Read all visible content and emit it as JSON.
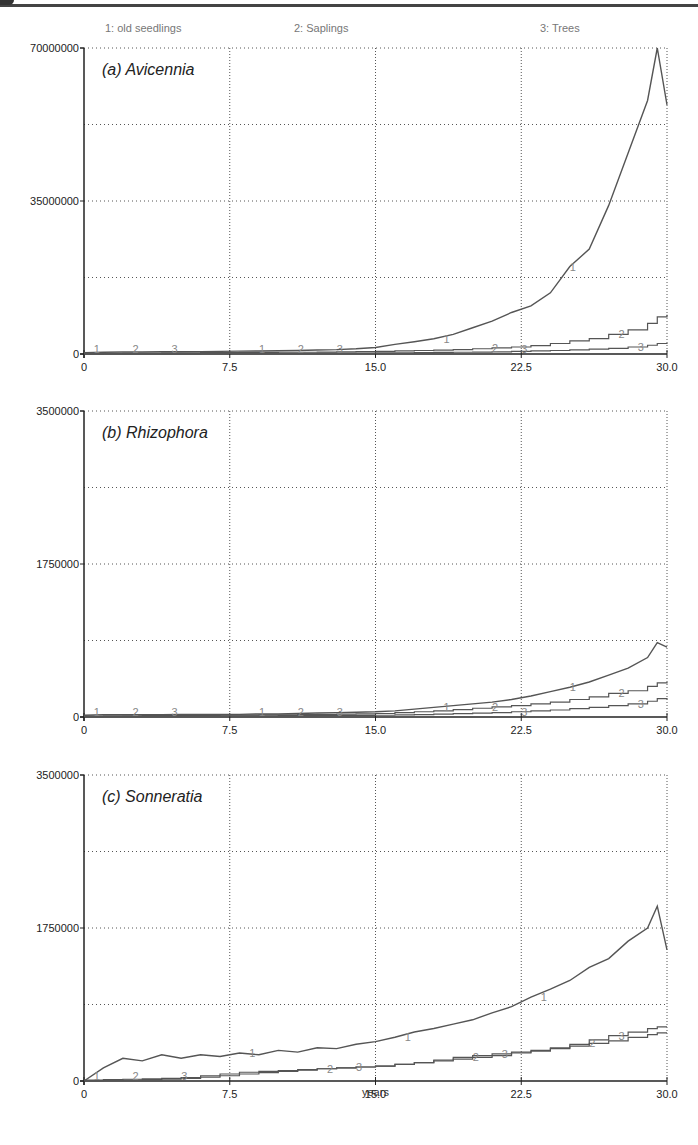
{
  "legend": [
    {
      "id": "1",
      "label": "1: old seedlings"
    },
    {
      "id": "2",
      "label": "2: Saplings"
    },
    {
      "id": "3",
      "label": "3: Trees"
    }
  ],
  "x_axis_label": "years",
  "colors": {
    "line": "#555555",
    "grid": "#555555",
    "axis": "#222222",
    "legend_text": "#777777"
  },
  "chart_data": [
    {
      "type": "line",
      "title": "(a) Avicennia",
      "xlabel": "years",
      "ylabel": "",
      "xlim": [
        0,
        30
      ],
      "ylim": [
        0,
        70000000
      ],
      "x_ticks": [
        "0",
        "7.5",
        "15.0",
        "22.5",
        "30.0"
      ],
      "y_ticks": [
        "0",
        "35000000",
        "70000000"
      ],
      "grid": true,
      "x": [
        0,
        1,
        2,
        3,
        4,
        5,
        6,
        7,
        8,
        9,
        10,
        11,
        12,
        13,
        14,
        15,
        16,
        17,
        18,
        19,
        20,
        21,
        22,
        23,
        24,
        25,
        26,
        27,
        28,
        29,
        29.5,
        30
      ],
      "series": [
        {
          "name": "1: old seedlings",
          "values": [
            300000,
            400000,
            450000,
            450000,
            500000,
            500000,
            550000,
            600000,
            650000,
            700000,
            750000,
            800000,
            900000,
            1000000,
            1200000,
            1500000,
            2200000,
            2800000,
            3500000,
            4500000,
            6000000,
            7500000,
            9500000,
            11000000,
            14000000,
            20000000,
            24000000,
            34000000,
            46000000,
            58000000,
            70000000,
            57000000
          ]
        },
        {
          "name": "2: Saplings",
          "values": [
            100000,
            150000,
            200000,
            200000,
            250000,
            250000,
            300000,
            300000,
            350000,
            350000,
            400000,
            400000,
            450000,
            500000,
            550000,
            600000,
            700000,
            800000,
            900000,
            1000000,
            1200000,
            1400000,
            1600000,
            1900000,
            2400000,
            3000000,
            3500000,
            4500000,
            5500000,
            7000000,
            8500000,
            9000000
          ]
        },
        {
          "name": "3: Trees",
          "values": [
            50000,
            60000,
            70000,
            80000,
            90000,
            100000,
            110000,
            120000,
            130000,
            140000,
            150000,
            160000,
            180000,
            200000,
            220000,
            250000,
            280000,
            320000,
            360000,
            400000,
            450000,
            500000,
            600000,
            700000,
            800000,
            950000,
            1100000,
            1300000,
            1600000,
            2000000,
            2400000,
            2500000
          ]
        }
      ],
      "annotations": [
        "1",
        "2",
        "3"
      ]
    },
    {
      "type": "line",
      "title": "(b) Rhizophora",
      "xlabel": "years",
      "ylabel": "",
      "xlim": [
        0,
        30
      ],
      "ylim": [
        0,
        3500000
      ],
      "x_ticks": [
        "0",
        "7.5",
        "15.0",
        "22.5",
        "30.0"
      ],
      "y_ticks": [
        "0",
        "1750000",
        "3500000"
      ],
      "grid": true,
      "x": [
        0,
        1,
        2,
        3,
        4,
        5,
        6,
        7,
        8,
        9,
        10,
        11,
        12,
        13,
        14,
        15,
        16,
        17,
        18,
        19,
        20,
        21,
        22,
        23,
        24,
        25,
        26,
        27,
        28,
        29,
        29.5,
        30
      ],
      "series": [
        {
          "name": "1: old seedlings",
          "values": [
            20000,
            25000,
            25000,
            25000,
            25000,
            30000,
            30000,
            30000,
            30000,
            35000,
            35000,
            40000,
            45000,
            50000,
            55000,
            60000,
            70000,
            90000,
            110000,
            130000,
            150000,
            170000,
            200000,
            240000,
            290000,
            340000,
            400000,
            480000,
            560000,
            680000,
            850000,
            800000
          ]
        },
        {
          "name": "2: Saplings",
          "values": [
            10000,
            12000,
            14000,
            15000,
            16000,
            17000,
            18000,
            20000,
            22000,
            24000,
            26000,
            28000,
            30000,
            32000,
            35000,
            40000,
            50000,
            60000,
            70000,
            85000,
            100000,
            115000,
            130000,
            150000,
            170000,
            200000,
            230000,
            270000,
            300000,
            350000,
            390000,
            400000
          ]
        },
        {
          "name": "3: Trees",
          "values": [
            5000,
            6000,
            7000,
            8000,
            9000,
            10000,
            11000,
            12000,
            13000,
            14000,
            15000,
            16000,
            17000,
            18000,
            19000,
            20000,
            24000,
            28000,
            32000,
            38000,
            44000,
            50000,
            60000,
            70000,
            80000,
            95000,
            110000,
            130000,
            150000,
            180000,
            210000,
            200000
          ]
        }
      ],
      "annotations": [
        "1",
        "2",
        "3"
      ]
    },
    {
      "type": "line",
      "title": "(c) Sonneratia",
      "xlabel": "years",
      "ylabel": "",
      "xlim": [
        0,
        30
      ],
      "ylim": [
        0,
        3500000
      ],
      "x_ticks": [
        "0",
        "7.5",
        "15.0",
        "22.5",
        "30.0"
      ],
      "y_ticks": [
        "0",
        "1750000",
        "3500000"
      ],
      "grid": true,
      "x": [
        0,
        1,
        2,
        3,
        4,
        5,
        6,
        7,
        8,
        9,
        10,
        11,
        12,
        13,
        14,
        15,
        16,
        17,
        18,
        19,
        20,
        21,
        22,
        23,
        24,
        25,
        26,
        27,
        28,
        29,
        29.5,
        30
      ],
      "series": [
        {
          "name": "1: old seedlings",
          "values": [
            0,
            150000,
            260000,
            230000,
            300000,
            260000,
            300000,
            280000,
            320000,
            300000,
            350000,
            330000,
            380000,
            370000,
            420000,
            450000,
            500000,
            560000,
            600000,
            650000,
            700000,
            780000,
            850000,
            960000,
            1050000,
            1150000,
            1300000,
            1400000,
            1600000,
            1750000,
            2000000,
            1500000
          ]
        },
        {
          "name": "2: Saplings",
          "values": [
            10000,
            15000,
            20000,
            25000,
            30000,
            40000,
            60000,
            80000,
            100000,
            110000,
            120000,
            130000,
            140000,
            150000,
            160000,
            170000,
            190000,
            210000,
            230000,
            250000,
            270000,
            290000,
            320000,
            340000,
            370000,
            400000,
            430000,
            460000,
            500000,
            530000,
            550000,
            550000
          ]
        },
        {
          "name": "3: Trees",
          "values": [
            5000,
            8000,
            10000,
            15000,
            20000,
            30000,
            45000,
            60000,
            80000,
            95000,
            110000,
            125000,
            140000,
            150000,
            160000,
            170000,
            190000,
            210000,
            240000,
            270000,
            290000,
            310000,
            330000,
            350000,
            380000,
            420000,
            470000,
            520000,
            560000,
            600000,
            620000,
            620000
          ]
        }
      ],
      "annotations": [
        "1",
        "2",
        "3"
      ]
    }
  ]
}
